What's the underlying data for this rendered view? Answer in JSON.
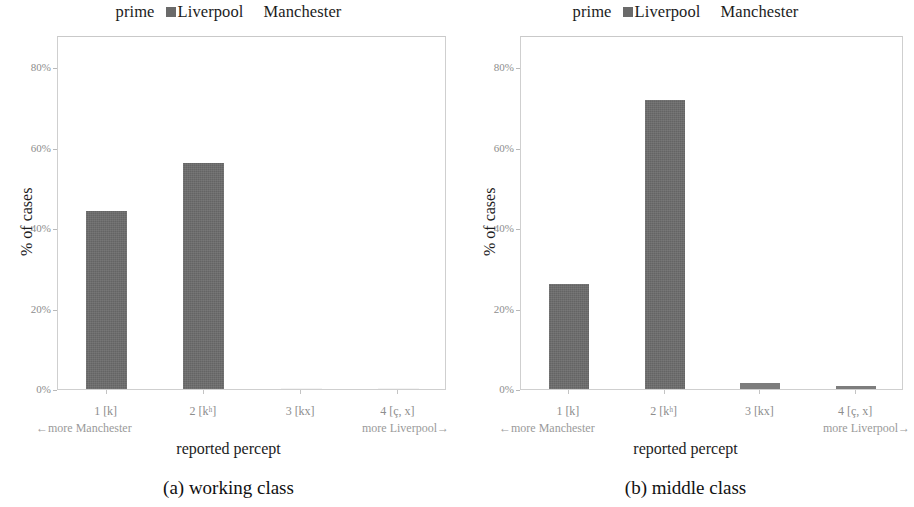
{
  "legend": {
    "prime_label": "prime",
    "series": [
      {
        "name": "Liverpool",
        "swatch": "#6a6a6a",
        "has_swatch": true
      },
      {
        "name": "Manchester",
        "swatch": "#ffffff",
        "has_swatch": false
      }
    ]
  },
  "axes": {
    "ylabel": "% of cases",
    "xlabel": "reported percept",
    "yticks": [
      "0%",
      "20%",
      "40%",
      "60%",
      "80%"
    ],
    "ytick_values": [
      0,
      20,
      40,
      60,
      80
    ],
    "xticks": [
      "1 [k]",
      "2 [kʰ]",
      "3 [kx]",
      "4 [ç, x]"
    ],
    "left_annotation": "←more Manchester",
    "right_annotation": "more Liverpool→"
  },
  "panels": [
    {
      "caption": "(a) working class"
    },
    {
      "caption": "(b) middle class"
    }
  ],
  "chart_data": [
    {
      "type": "bar",
      "title": "(a) working class",
      "categories": [
        "1 [k]",
        "2 [kʰ]",
        "3 [kx]",
        "4 [ç, x]"
      ],
      "values": [
        44.2,
        56.2,
        0.0,
        0.0
      ],
      "series": [
        {
          "name": "Liverpool",
          "values": [
            44.2,
            56.2,
            0.0,
            0.0
          ],
          "color": "#6b6b6b"
        }
      ],
      "xlabel": "reported percept",
      "ylabel": "% of cases",
      "ylim": [
        0,
        88
      ],
      "yticks": [
        0,
        20,
        40,
        60,
        80
      ],
      "ytick_labels": [
        "0%",
        "20%",
        "40%",
        "60%",
        "80%"
      ],
      "grid": false,
      "legend": "top-center",
      "annotations": [
        "←more Manchester",
        "more Liverpool→",
        "prime",
        "Liverpool",
        "Manchester"
      ]
    },
    {
      "type": "bar",
      "title": "(b) middle class",
      "categories": [
        "1 [k]",
        "2 [kʰ]",
        "3 [kx]",
        "4 [ç, x]"
      ],
      "values": [
        26.1,
        71.8,
        1.5,
        0.7
      ],
      "series": [
        {
          "name": "Liverpool",
          "values": [
            26.1,
            71.8,
            1.5,
            0.7
          ],
          "color": "#6b6b6b"
        }
      ],
      "xlabel": "reported percept",
      "ylabel": "% of cases",
      "ylim": [
        0,
        88
      ],
      "yticks": [
        0,
        20,
        40,
        60,
        80
      ],
      "ytick_labels": [
        "0%",
        "20%",
        "40%",
        "60%",
        "80%"
      ],
      "grid": false,
      "legend": "top-center",
      "annotations": [
        "←more Manchester",
        "more Liverpool→",
        "prime",
        "Liverpool",
        "Manchester"
      ]
    }
  ],
  "colors": {
    "bar": "#6b6b6b",
    "frame": "#cfcfcf",
    "tick_text": "#8d8d8d",
    "text": "#1c1c1c"
  }
}
